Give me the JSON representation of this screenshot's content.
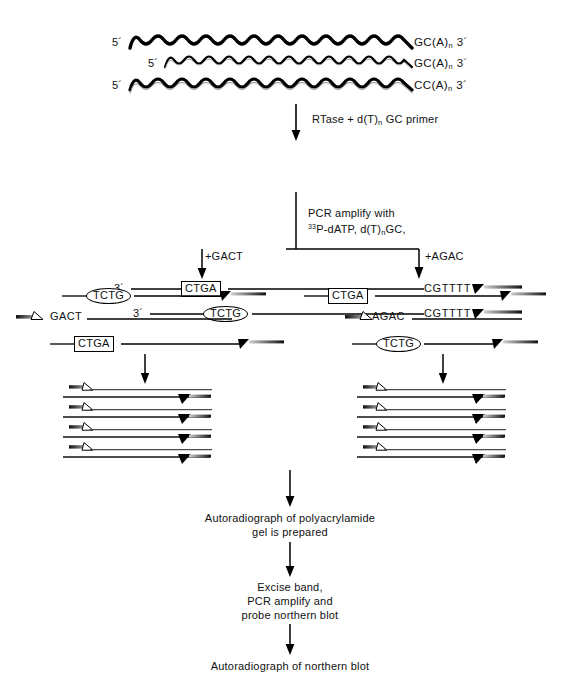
{
  "figure": {
    "type": "molecular-biology-flow-diagram"
  },
  "top_strands": {
    "five_prime": "5´",
    "three_prime": "3´",
    "rows": [
      {
        "left_label": "5´",
        "right_label": "GC(A)",
        "subscript": "n",
        "tail": "3´"
      },
      {
        "left_label": "5´",
        "right_label": "GC(A)",
        "subscript": "n",
        "tail": "3´"
      },
      {
        "left_label": "5´",
        "right_label": "CC(A)",
        "subscript": "n",
        "tail": "3´"
      }
    ]
  },
  "step1": {
    "arrow_label_parts": [
      "RTase + d(T)",
      "n",
      " GC primer"
    ],
    "arrow_label_full": "RTase + d(T)n GC primer"
  },
  "cdna_rows": [
    {
      "left_prime": "3´",
      "tag": "CTGA",
      "tag_shape": "rect",
      "right_seq": "CGTTTT"
    },
    {
      "left_prime": "3´",
      "tag": "TCTG",
      "tag_shape": "oval",
      "right_seq": "CGTTTT"
    }
  ],
  "step2": {
    "line1": "PCR amplify with",
    "line2_sup": "33",
    "line2": "P-dATP, d(T)",
    "line2_sub": "n",
    "line2_end": "GC,",
    "branch_left": "+GACT",
    "branch_right": "+AGAC"
  },
  "panels": {
    "left": {
      "name": "gact-panel",
      "rows": [
        {
          "tag": "TCTG",
          "tag_shape": "oval",
          "has_right_end": true,
          "primer_label": ""
        },
        {
          "tag": "",
          "tag_shape": "none",
          "has_right_end": false,
          "primer_label": "GACT"
        },
        {
          "tag": "CTGA",
          "tag_shape": "rect",
          "has_right_end": true,
          "primer_label": ""
        }
      ],
      "ladder_pairs": 4
    },
    "right": {
      "name": "agac-panel",
      "rows": [
        {
          "tag": "CTGA",
          "tag_shape": "rect",
          "has_right_end": true,
          "primer_label": ""
        },
        {
          "tag": "",
          "tag_shape": "none",
          "has_right_end": false,
          "primer_label": "AGAC"
        },
        {
          "tag": "TCTG",
          "tag_shape": "oval",
          "has_right_end": true,
          "primer_label": ""
        }
      ],
      "ladder_pairs": 4
    }
  },
  "step3": {
    "line1": "Autoradiograph of polyacrylamide",
    "line2": "gel is prepared"
  },
  "step4": {
    "line1": "Excise band,",
    "line2": "PCR amplify and",
    "line3": "probe northern blot"
  },
  "step5": {
    "line1": "Autoradiograph of northern blot"
  },
  "colors": {
    "ink": "#000000",
    "background": "#ffffff",
    "gradient_light": "#c8c8c8",
    "gradient_dark": "#1a1a1a"
  }
}
